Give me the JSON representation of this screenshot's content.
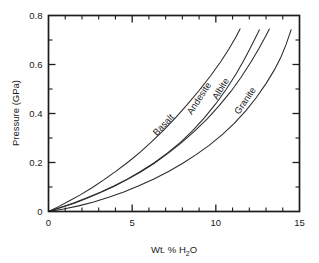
{
  "chart_data": {
    "type": "line",
    "title": "",
    "xlabel": "Wt. % H2O",
    "xlabel_parts": {
      "pre": "Wt. % H",
      "sub": "2",
      "post": "O"
    },
    "ylabel": "Pressure (GPa)",
    "xlim": [
      0,
      15
    ],
    "ylim": [
      0,
      0.8
    ],
    "xticks": [
      0,
      5,
      10,
      15
    ],
    "xticklabels": [
      "0",
      "5",
      "10",
      "15"
    ],
    "x_minor_step": 1,
    "yticks": [
      0,
      0.2,
      0.4,
      0.6,
      0.8
    ],
    "yticklabels": [
      "0",
      "0.2",
      "0.4",
      "0.6",
      "0.8"
    ],
    "y_minor_step": 0.1,
    "grid": false,
    "legend": "inline-curve-labels",
    "frame": "box",
    "tick_direction": "in",
    "series": [
      {
        "name": "Basalt",
        "label_x": 7.0,
        "label_y": 0.345,
        "label_rotation": -46,
        "points": [
          [
            0.0,
            0.0
          ],
          [
            0.6,
            0.02
          ],
          [
            1.2,
            0.042
          ],
          [
            1.9,
            0.068
          ],
          [
            2.6,
            0.097
          ],
          [
            3.3,
            0.129
          ],
          [
            4.0,
            0.163
          ],
          [
            4.8,
            0.204
          ],
          [
            5.5,
            0.243
          ],
          [
            6.2,
            0.287
          ],
          [
            6.9,
            0.333
          ],
          [
            7.6,
            0.383
          ],
          [
            8.3,
            0.437
          ],
          [
            9.0,
            0.494
          ],
          [
            9.7,
            0.555
          ],
          [
            10.3,
            0.612
          ],
          [
            10.8,
            0.665
          ],
          [
            11.2,
            0.712
          ],
          [
            11.45,
            0.745
          ]
        ]
      },
      {
        "name": "Andesite",
        "label_x": 9.15,
        "label_y": 0.455,
        "label_rotation": -57,
        "points": [
          [
            0.0,
            0.0
          ],
          [
            0.7,
            0.016
          ],
          [
            1.5,
            0.035
          ],
          [
            2.3,
            0.056
          ],
          [
            3.1,
            0.079
          ],
          [
            3.9,
            0.104
          ],
          [
            4.7,
            0.132
          ],
          [
            5.5,
            0.163
          ],
          [
            6.3,
            0.198
          ],
          [
            7.1,
            0.238
          ],
          [
            7.9,
            0.283
          ],
          [
            8.6,
            0.329
          ],
          [
            9.3,
            0.381
          ],
          [
            10.0,
            0.44
          ],
          [
            10.6,
            0.497
          ],
          [
            11.2,
            0.56
          ],
          [
            11.7,
            0.62
          ],
          [
            12.1,
            0.672
          ],
          [
            12.45,
            0.72
          ],
          [
            12.6,
            0.742
          ]
        ]
      },
      {
        "name": "Albite",
        "label_x": 10.45,
        "label_y": 0.495,
        "label_rotation": -59,
        "points": [
          [
            0.0,
            0.0
          ],
          [
            0.7,
            0.015
          ],
          [
            1.5,
            0.033
          ],
          [
            2.3,
            0.054
          ],
          [
            3.1,
            0.077
          ],
          [
            3.9,
            0.102
          ],
          [
            4.7,
            0.13
          ],
          [
            5.5,
            0.161
          ],
          [
            6.3,
            0.196
          ],
          [
            7.1,
            0.235
          ],
          [
            7.9,
            0.278
          ],
          [
            8.7,
            0.326
          ],
          [
            9.5,
            0.379
          ],
          [
            10.2,
            0.432
          ],
          [
            10.9,
            0.49
          ],
          [
            11.5,
            0.547
          ],
          [
            12.1,
            0.61
          ],
          [
            12.6,
            0.668
          ],
          [
            13.0,
            0.718
          ],
          [
            13.2,
            0.745
          ]
        ]
      },
      {
        "name": "Granite",
        "label_x": 11.9,
        "label_y": 0.445,
        "label_rotation": -56,
        "points": [
          [
            0.0,
            0.0
          ],
          [
            0.9,
            0.01
          ],
          [
            1.8,
            0.023
          ],
          [
            2.7,
            0.039
          ],
          [
            3.6,
            0.058
          ],
          [
            4.5,
            0.08
          ],
          [
            5.4,
            0.105
          ],
          [
            6.3,
            0.133
          ],
          [
            7.2,
            0.164
          ],
          [
            8.0,
            0.196
          ],
          [
            8.8,
            0.231
          ],
          [
            9.6,
            0.27
          ],
          [
            10.4,
            0.315
          ],
          [
            11.1,
            0.36
          ],
          [
            11.8,
            0.412
          ],
          [
            12.4,
            0.463
          ],
          [
            13.0,
            0.522
          ],
          [
            13.5,
            0.578
          ],
          [
            13.9,
            0.632
          ],
          [
            14.2,
            0.682
          ],
          [
            14.4,
            0.722
          ],
          [
            14.5,
            0.742
          ]
        ]
      }
    ]
  }
}
